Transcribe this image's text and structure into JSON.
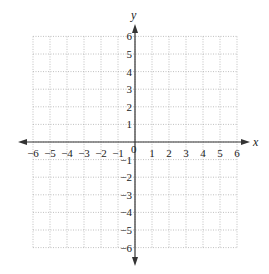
{
  "diagram": {
    "type": "coordinate-plane",
    "x_axis": {
      "label": "x",
      "min": -6,
      "max": 6,
      "step": 1
    },
    "y_axis": {
      "label": "y",
      "min": -6,
      "max": 6,
      "step": 1
    },
    "origin_label": "0",
    "x_tick_labels": [
      "−6",
      "−5",
      "−4",
      "−3",
      "−2",
      "−1",
      "1",
      "2",
      "3",
      "4",
      "5",
      "6"
    ],
    "y_tick_labels": [
      "6",
      "5",
      "4",
      "3",
      "2",
      "1",
      "−1",
      "−2",
      "−3",
      "−4",
      "−5",
      "−6"
    ],
    "grid": {
      "style": "dotted",
      "color": "#b0b0b0"
    },
    "axis_color": "#333333"
  }
}
